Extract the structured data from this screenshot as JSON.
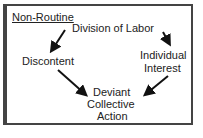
{
  "diagram": {
    "title": "Non-Routine",
    "nodes": {
      "division": "Division of Labor",
      "discontent": "Discontent",
      "interest_1": "Individual",
      "interest_2": "Interest",
      "deviant_1": "Deviant",
      "deviant_2": "Collective",
      "deviant_3": "Action"
    },
    "edges": [
      {
        "from": "Division of Labor",
        "to": "Discontent"
      },
      {
        "from": "Division of Labor",
        "to": "Individual Interest"
      },
      {
        "from": "Discontent",
        "to": "Deviant Collective Action"
      },
      {
        "from": "Individual Interest",
        "to": "Deviant Collective Action"
      }
    ]
  }
}
